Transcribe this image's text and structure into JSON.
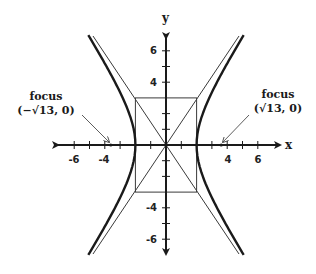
{
  "diagram": {
    "type": "hyperbola",
    "equation_params": {
      "a": 2,
      "b": 3,
      "c_squared": 13
    },
    "origin_px": [
      166,
      145
    ],
    "unit_px": {
      "x": 15.3,
      "y": 15.7
    },
    "axes": {
      "x_label": "x",
      "y_label": "y",
      "x_ticks": [
        "-6",
        "-4",
        "4",
        "6"
      ],
      "y_ticks": [
        "6",
        "4",
        "-4",
        "-6"
      ]
    },
    "foci": [
      {
        "label": "focus",
        "coords": "(−√13, 0)",
        "x": -3.606
      },
      {
        "label": "focus",
        "coords": "(√13, 0)",
        "x": 3.606
      }
    ],
    "vertices": [
      [
        -2,
        0
      ],
      [
        2,
        0
      ]
    ],
    "reference_box": {
      "x": [
        -2,
        2
      ],
      "y": [
        -3,
        3
      ]
    },
    "asymptotes": [
      "y = 1.5x",
      "y = -1.5x"
    ],
    "colors": {
      "curve": "#1a1a1a",
      "axis": "#1a1a1a",
      "guide": "#3a3a3a"
    }
  }
}
